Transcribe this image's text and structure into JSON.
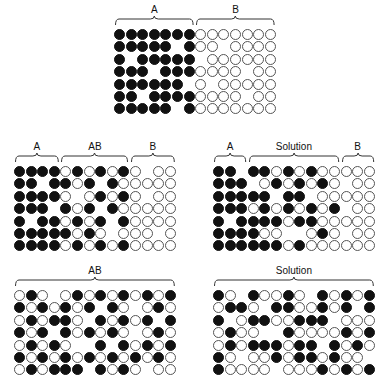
{
  "colors": {
    "filled": "#111111",
    "open_border": "#555555",
    "background": "#ffffff"
  },
  "legend": {
    "B": "filled-circle",
    "W": "open-circle",
    "_": "empty"
  },
  "panels": {
    "top": {
      "braces": [
        {
          "label": "A",
          "from_col": 0,
          "to_col": 6
        },
        {
          "label": "B",
          "from_col": 7,
          "to_col": 13
        }
      ],
      "rows": [
        "BBBBBBBWWWWWWW",
        "BBBBB_BWW_WWWW",
        "B_BBBBB_WWWWWW",
        "BBB_BBBWWWW_WW",
        "BBBBBB_W_WWWWW",
        "BB_BBBBWWWW_WW",
        "BBBBB_BWWWWWWW"
      ]
    },
    "middle_left": {
      "braces": [
        {
          "label": "A",
          "from_col": 0,
          "to_col": 3
        },
        {
          "label": "AB",
          "from_col": 4,
          "to_col": 9
        },
        {
          "label": "B",
          "from_col": 10,
          "to_col": 13
        }
      ],
      "rows": [
        "BBBBWBWBWBW_WW",
        "BB_BBWB_BWWWWW",
        "BBBBW_WBWBW_WW",
        "BBB_BWB_BWWWWW",
        "B_BBWBWB_BWWWW",
        "BBBBBWBW_WWW_W",
        "BBBBWBWBWBWWWW"
      ]
    },
    "middle_right": {
      "braces": [
        {
          "label": "A",
          "from_col": 0,
          "to_col": 2
        },
        {
          "label": "Solution",
          "from_col": 3,
          "to_col": 10
        },
        {
          "label": "B",
          "from_col": 11,
          "to_col": 13
        }
      ],
      "rows": [
        "BB_BBWBWBWWWWW",
        "BBB_WBWBWBW_WW",
        "BBBBB_BB_WWWWW",
        "BBBWBWBWBWB_WW",
        "B_BBBBWBBWWWWW",
        "BBBBWW__WBW_WW",
        "BBBBBBWBWWWWWW"
      ]
    },
    "bottom_left": {
      "braces": [
        {
          "label": "AB",
          "from_col": 0,
          "to_col": 13
        }
      ],
      "rows": [
        "WBW_WBWBWBWBWB",
        "BWBWBWB_BW_WBW",
        "WBWBBW_BWBWB_B",
        "BWB_BWBWBW_WBW",
        "WBWBW__B_BWBWB",
        "BWBWBWBWBWBWBW",
        "WBWBBB_BWBW_WW"
      ]
    },
    "bottom_right": {
      "braces": [
        {
          "label": "Solution",
          "from_col": 0,
          "to_col": 13
        }
      ],
      "rows": [
        "BW_BWWBW_BWBWB",
        "WBBW_BBWWBWB_BW",
        "B_WBBWWBBB_WWWB",
        "WBWW__BWWWWBWBW",
        "WBWBBBWBB_BWBWB",
        "BW_WWBWBBWBWW_B",
        "BWWWW_WWWBWBWBW"
      ]
    }
  }
}
